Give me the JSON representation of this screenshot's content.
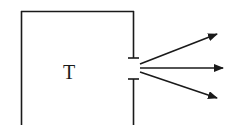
{
  "diagram": {
    "box_label": "T",
    "stroke_color": "#1a1a1a",
    "background": "#ffffff",
    "arrows": [
      {
        "direction": "up-right"
      },
      {
        "direction": "right"
      },
      {
        "direction": "down-right"
      }
    ]
  }
}
